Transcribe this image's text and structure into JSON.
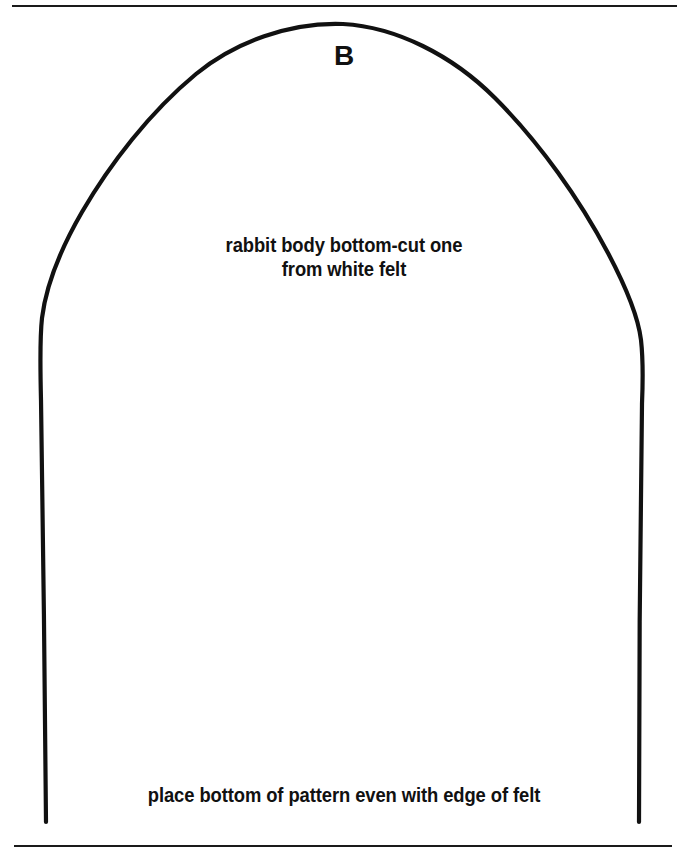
{
  "page": {
    "background_color": "#ffffff",
    "ink_color": "#111111",
    "width": 688,
    "height": 850
  },
  "rules": {
    "top": {
      "name": "top-divider-rule"
    },
    "bottom": {
      "name": "bottom-divider-rule"
    }
  },
  "pattern": {
    "shape_name": "rabbit-body-bottom-outline",
    "stroke_color": "#111111",
    "stroke_width": 4,
    "fill": "none",
    "piece_letter": "B",
    "description_line_1": "rabbit body bottom-cut one",
    "description_line_2": "from white felt",
    "placement_note": "place bottom of pattern even with edge of felt"
  }
}
